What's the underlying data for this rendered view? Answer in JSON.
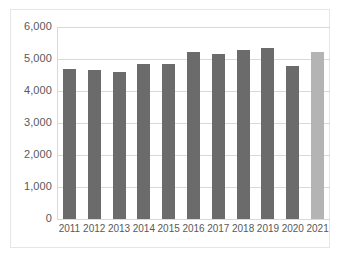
{
  "chart_data": {
    "type": "bar",
    "title": "",
    "subtitle": "",
    "xlabel": "",
    "ylabel": "",
    "categories": [
      "2011",
      "2012",
      "2013",
      "2014",
      "2015",
      "2016",
      "2017",
      "2018",
      "2019",
      "2020",
      "2021"
    ],
    "values": [
      4700,
      4650,
      4600,
      4830,
      4850,
      5220,
      5160,
      5280,
      5350,
      4790,
      5210
    ],
    "series": [
      {
        "name": "",
        "values": [
          4700,
          4650,
          4600,
          4830,
          4850,
          5220,
          5160,
          5280,
          5350,
          4790,
          5210
        ]
      }
    ],
    "bar_colors": [
      "#6b6b6b",
      "#6b6b6b",
      "#6b6b6b",
      "#6b6b6b",
      "#6b6b6b",
      "#6b6b6b",
      "#6b6b6b",
      "#6b6b6b",
      "#6b6b6b",
      "#6b6b6b",
      "#b4b4b4"
    ],
    "ylim": [
      0,
      6000
    ],
    "ytick_values": [
      6000,
      5000,
      4000,
      3000,
      2000,
      1000,
      0
    ],
    "ytick_labels": [
      "6,000",
      "5,000",
      "4,000",
      "3,000",
      "2,000",
      "1,000",
      "0"
    ],
    "grid": true,
    "grid_axis": "y",
    "legend": false,
    "legend_position": "none",
    "annotations": []
  },
  "style": {
    "bar_color_primary": "#6b6b6b",
    "bar_color_highlight": "#b4b4b4",
    "gridline_color": "#d9d9d9",
    "axis_text_color": "#595959",
    "frame_color": "#e6e6e6",
    "background": "#ffffff"
  }
}
